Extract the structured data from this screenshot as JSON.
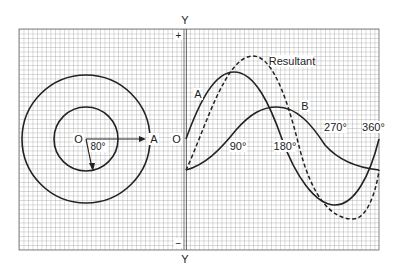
{
  "diagram": {
    "axis": {
      "top_label": "Y",
      "bottom_label": "Y",
      "plus_sign": "+",
      "minus_sign": "−"
    },
    "phasor": {
      "origin_label": "O",
      "phasor_a_label": "A",
      "angle_label": "80°"
    },
    "waveforms": {
      "origin_label": "O",
      "curve_a_label": "A",
      "curve_b_label": "B",
      "resultant_label": "Resultant",
      "tick_90": "90°",
      "tick_180": "180°",
      "tick_270": "270°",
      "tick_360": "360°"
    },
    "colors": {
      "grid": "#8a8a8a",
      "curve": "#222222",
      "background": "#ffffff"
    }
  }
}
